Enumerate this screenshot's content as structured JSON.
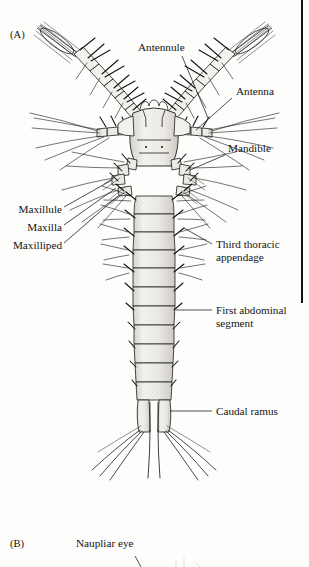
{
  "figure": {
    "type": "scientific-illustration-plate",
    "background_color": "#fdfdfb",
    "ink_color": "#141414"
  },
  "panels": [
    {
      "id": "panel-a",
      "label": "(A)"
    },
    {
      "id": "panel-b",
      "label": "(B)"
    }
  ],
  "labels": {
    "antennule": "Antennule",
    "antenna": "Antenna",
    "mandible": "Mandible",
    "maxillule": "Maxillule",
    "maxilla": "Maxilla",
    "maxilliped": "Maxilliped",
    "third_thoracic_appendage": "Third thoracic\nappendage",
    "third_thoracic_appendage_line1": "Third thoracic",
    "third_thoracic_appendage_line2": "appendage",
    "first_abdominal_segment_line1": "First abdominal",
    "first_abdominal_segment_line2": "segment",
    "caudal_ramus": "Caudal ramus",
    "naupliar_eye": "Naupliar eye"
  },
  "callouts": [
    {
      "name": "antennule",
      "text": "Antennule",
      "side": "center",
      "leader": "diagonal-down-right"
    },
    {
      "name": "antenna",
      "text": "Antenna",
      "side": "right",
      "leader": "diagonal-down-left"
    },
    {
      "name": "mandible",
      "text": "Mandible",
      "side": "right",
      "leader": "diagonal-down-left"
    },
    {
      "name": "maxillule",
      "text": "Maxillule",
      "side": "left",
      "leader": "diagonal-up-right"
    },
    {
      "name": "maxilla",
      "text": "Maxilla",
      "side": "left",
      "leader": "diagonal-up-right"
    },
    {
      "name": "maxilliped",
      "text": "Maxilliped",
      "side": "left",
      "leader": "diagonal-up-right"
    },
    {
      "name": "third-thoracic-appendage",
      "text": "Third thoracic appendage",
      "side": "right",
      "leader": "diagonal-up-left"
    },
    {
      "name": "first-abdominal-segment",
      "text": "First abdominal segment",
      "side": "right",
      "leader": "horizontal-left"
    },
    {
      "name": "caudal-ramus",
      "text": "Caudal ramus",
      "side": "right",
      "leader": "horizontal-left"
    },
    {
      "name": "naupliar-eye",
      "text": "Naupliar eye",
      "side": "center",
      "leader": "vertical-down"
    }
  ],
  "page_rule": {
    "name": "right-margin-rule",
    "color": "#111111"
  }
}
